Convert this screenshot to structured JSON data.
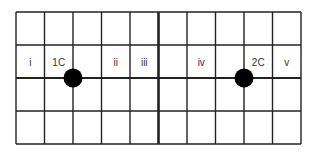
{
  "diagram": {
    "grid": {
      "left": 16,
      "top": 12,
      "right": 301,
      "bottom": 144,
      "columns": 10,
      "rows": 4,
      "line_color": "#222222",
      "center_divider_column": 5
    },
    "labels": [
      {
        "text": "i",
        "col": 0,
        "row": 1
      },
      {
        "text": "1C",
        "col": 1,
        "row": 1
      },
      {
        "text": "ii",
        "col": 3,
        "row": 1
      },
      {
        "text": "iii",
        "col": 4,
        "row": 1
      },
      {
        "text": "iv",
        "col": 6,
        "row": 1
      },
      {
        "text": "2C",
        "col": 8,
        "row": 1
      },
      {
        "text": "v",
        "col": 9,
        "row": 1
      }
    ],
    "dots": [
      {
        "name": "1C",
        "grid_x": 2,
        "grid_y": 2,
        "diameter": 19
      },
      {
        "name": "2C",
        "grid_x": 8,
        "grid_y": 2,
        "diameter": 19
      }
    ]
  }
}
